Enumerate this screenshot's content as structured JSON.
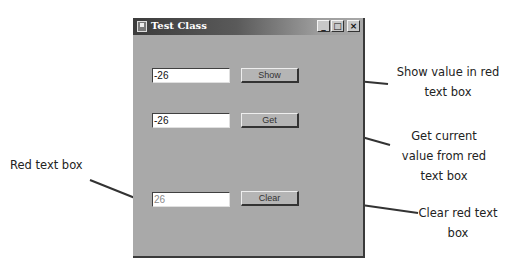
{
  "window": {
    "title": "Test Class",
    "caption_buttons": {
      "minimize": "_",
      "maximize": "□",
      "close": "×"
    }
  },
  "rows": [
    {
      "textbox_value": "-26",
      "button_label": "Show"
    },
    {
      "textbox_value": "-26",
      "button_label": "Get"
    },
    {
      "textbox_value": "26",
      "button_label": "Clear"
    }
  ],
  "annotations": {
    "show": "Show value in red text box",
    "get": "Get current value from red text box",
    "clear": "Clear red text box",
    "red_box": "Red text box"
  },
  "colors": {
    "window_bg": "#a9a9a9",
    "red_text_box_text": "#8a8a8a"
  }
}
